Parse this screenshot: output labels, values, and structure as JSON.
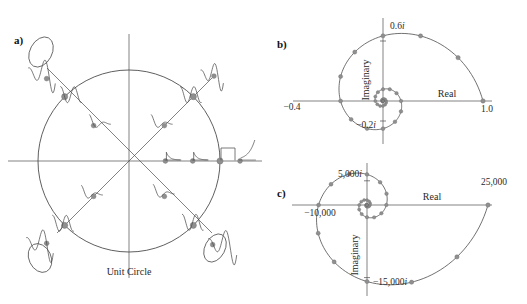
{
  "figure": {
    "background": "#ffffff",
    "ink_color": "#4d4d4d",
    "marker_color": "#8f8f8f",
    "text_color": "#1a1a1a"
  },
  "panels": {
    "a": {
      "letter": "a)",
      "caption": "Unit Circle",
      "center": [
        129,
        161
      ],
      "radius": 91,
      "axes": {
        "horizontal": {
          "x1": 8,
          "x2": 262,
          "y": 161
        },
        "vertical": {
          "y1": 34,
          "y2": 278,
          "x": 129
        },
        "diagonal_up_right": {
          "x1": 57,
          "y1": 233,
          "x2": 212,
          "y2": 78
        },
        "diagonal_up_left": {
          "x1": 212,
          "y1": 233,
          "x2": 47,
          "y2": 68
        }
      },
      "pole_groups": [
        {
          "name": "positive-real-axis",
          "angle_deg": 0,
          "response_type": "decaying-then-growing exponential",
          "poles": [
            {
              "r": 0.4,
              "role": "inside-circle"
            },
            {
              "r": 0.7,
              "role": "inside-circle"
            },
            {
              "r": 1.0,
              "role": "on-circle"
            },
            {
              "r": 1.22,
              "role": "outside-circle"
            }
          ]
        },
        {
          "name": "upper-right-diagonal",
          "angle_deg": 45,
          "response_type": "decaying oscillation",
          "poles": [
            {
              "r": 0.55,
              "role": "inside-circle"
            },
            {
              "r": 1.0,
              "role": "on-circle"
            },
            {
              "r": 1.32,
              "role": "outside-circle"
            }
          ]
        },
        {
          "name": "upper-left-diagonal",
          "angle_deg": 135,
          "response_type": "fast alternating oscillation",
          "poles": [
            {
              "r": 0.55,
              "role": "inside-circle"
            },
            {
              "r": 1.0,
              "role": "on-circle"
            },
            {
              "r": 1.28,
              "role": "outside-circle"
            }
          ]
        },
        {
          "name": "lower-left-diagonal",
          "angle_deg": 225,
          "response_type": "alternating growing oscillation",
          "poles": [
            {
              "r": 0.55,
              "role": "inside-circle"
            },
            {
              "r": 1.0,
              "role": "on-circle"
            },
            {
              "r": 1.28,
              "role": "outside-circle"
            }
          ]
        },
        {
          "name": "lower-right-diagonal",
          "angle_deg": 315,
          "response_type": "growing oscillation",
          "poles": [
            {
              "r": 0.55,
              "role": "inside-circle"
            },
            {
              "r": 1.0,
              "role": "on-circle"
            },
            {
              "r": 1.3,
              "role": "outside-circle"
            }
          ]
        }
      ]
    },
    "b": {
      "letter": "b)",
      "labels": {
        "real_axis": "Real",
        "imaginary_axis": "Imaginary",
        "tick_pos_imag": "0.6i",
        "tick_neg_imag": "-0.2i",
        "tick_neg_real": "-0.4",
        "tick_pos_real": "1.0"
      }
    },
    "c": {
      "letter": "c)",
      "labels": {
        "real_axis": "Real",
        "imaginary_axis": "Imaginary",
        "tick_pos_imag": "5,000i",
        "tick_neg_imag": "-15,000i",
        "tick_neg_real": "-10,000",
        "tick_pos_real": "25,000"
      }
    }
  },
  "chart_data": [
    {
      "type": "scatter",
      "name": "panel-b-decaying-spiral",
      "title": "Decaying logarithmic spiral (pole inside unit circle)",
      "xlabel": "Real",
      "ylabel": "Imaginary",
      "xlim": [
        -0.4,
        1.0
      ],
      "ylim": [
        -0.3,
        0.62
      ],
      "grid": false,
      "legend": null,
      "spiral": {
        "start_radius": 1.0,
        "decay_per_turn": 0.18,
        "turns": 4.0,
        "start_angle_deg": 0,
        "direction": "counterclockwise",
        "samples_per_turn": 12
      },
      "annotations": [
        {
          "text": "1.0",
          "x": 1.0,
          "y": 0.0
        },
        {
          "text": "-0.4",
          "x": -0.4,
          "y": 0.0
        },
        {
          "text": "0.6i",
          "x": 0.0,
          "y": 0.6
        },
        {
          "text": "-0.2i",
          "x": 0.0,
          "y": -0.2
        }
      ]
    },
    {
      "type": "scatter",
      "name": "panel-c-growing-spiral",
      "title": "Growing logarithmic spiral (pole outside unit circle)",
      "xlabel": "Real",
      "ylabel": "Imaginary",
      "xlim": [
        -10000,
        25000
      ],
      "ylim": [
        -16000,
        7000
      ],
      "grid": false,
      "legend": null,
      "spiral": {
        "start_radius": 25000,
        "decay_per_turn": 0.16,
        "turns": 4.0,
        "start_angle_deg": 0,
        "direction": "clockwise",
        "samples_per_turn": 12
      },
      "annotations": [
        {
          "text": "25,000",
          "x": 25000,
          "y": 0
        },
        {
          "text": "-10,000",
          "x": -10000,
          "y": 0
        },
        {
          "text": "5,000i",
          "x": 0,
          "y": 5000
        },
        {
          "text": "-15,000i",
          "x": 0,
          "y": -15000
        }
      ]
    }
  ]
}
